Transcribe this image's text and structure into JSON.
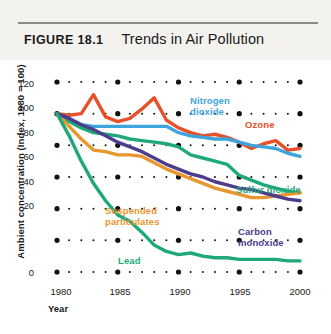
{
  "figure": {
    "number": "FIGURE 18.1",
    "title": "Trends in Air Pollution"
  },
  "chart_data": {
    "type": "line",
    "title": "Trends in Air Pollution",
    "xlabel": "Year",
    "ylabel": "Ambient concentration (Index, 1980 = 100)",
    "xlim": [
      1980,
      2000
    ],
    "ylim": [
      0,
      120
    ],
    "xticks": [
      "1980",
      "1985",
      "1990",
      "1995",
      "2000"
    ],
    "yticks": [
      "0",
      "20",
      "40",
      "60",
      "80",
      "100",
      "120"
    ],
    "grid": "dotted",
    "legend_position": "inline-labels",
    "x": [
      1980,
      1981,
      1982,
      1983,
      1984,
      1985,
      1986,
      1987,
      1988,
      1989,
      1990,
      1991,
      1992,
      1993,
      1994,
      1995,
      1996,
      1997,
      1998,
      1999,
      2000
    ],
    "series": [
      {
        "name": "Ozone",
        "color": "#E8502A",
        "label": "Ozone",
        "values": [
          100,
          99,
          100,
          112,
          98,
          95,
          97,
          103,
          110,
          96,
          91,
          88,
          86,
          87,
          85,
          82,
          78,
          81,
          83,
          77,
          78
        ]
      },
      {
        "name": "Nitrogen dioxide",
        "color": "#3DA5DC",
        "label": "Nitrogen\ndioxide",
        "values": [
          100,
          97,
          93,
          92,
          92,
          92,
          92,
          92,
          92,
          92,
          88,
          86,
          85,
          84,
          84,
          82,
          80,
          79,
          78,
          75,
          73
        ]
      },
      {
        "name": "Sulfur dioxide",
        "color": "#1FA87A",
        "label": "Sulfur dioxide",
        "values": [
          100,
          95,
          91,
          88,
          87,
          86,
          84,
          83,
          82,
          81,
          79,
          74,
          72,
          70,
          68,
          61,
          58,
          55,
          53,
          51,
          50
        ]
      },
      {
        "name": "Suspended particulates",
        "color": "#E8962E",
        "label": "Suspended\nparticulates",
        "values": [
          100,
          92,
          84,
          77,
          76,
          74,
          74,
          73,
          69,
          65,
          62,
          59,
          56,
          53,
          51,
          49,
          47,
          47,
          48,
          49,
          50
        ]
      },
      {
        "name": "Carbon monoxide",
        "color": "#4B3C8C",
        "label": "Carbon\nmonoxide",
        "values": [
          100,
          97,
          93,
          90,
          86,
          82,
          79,
          76,
          72,
          68,
          65,
          62,
          60,
          57,
          55,
          53,
          52,
          50,
          48,
          46,
          45
        ]
      },
      {
        "name": "Lead",
        "color": "#1FA87A",
        "label": "Lead",
        "values": [
          100,
          86,
          70,
          56,
          45,
          36,
          32,
          25,
          17,
          13,
          11,
          12,
          10,
          9,
          9,
          8,
          8,
          8,
          8,
          7,
          7
        ]
      }
    ]
  }
}
